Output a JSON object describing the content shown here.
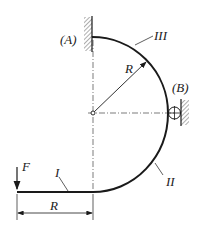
{
  "diagram": {
    "title": "",
    "labels": {
      "support_a": "(A)",
      "support_b": "(B)",
      "segment_1": "I",
      "segment_2": "II",
      "segment_3": "III",
      "radius": "R",
      "force": "F",
      "dimension": "R"
    },
    "colors": {
      "line": "#1a1a1a",
      "background": "#ffffff"
    }
  }
}
